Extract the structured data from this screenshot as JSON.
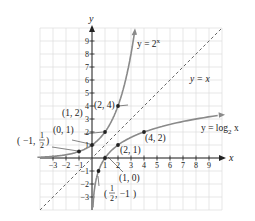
{
  "chart_data": {
    "type": "line",
    "title": "",
    "xlabel": "x",
    "ylabel": "y",
    "xlim": [
      -4,
      10
    ],
    "ylim": [
      -4,
      10
    ],
    "grid": true,
    "x_ticks": [
      -3,
      -2,
      -1,
      1,
      2,
      3,
      4,
      5,
      6,
      7,
      8,
      9
    ],
    "y_ticks": [
      -3,
      -2,
      -1,
      1,
      2,
      3,
      4,
      5,
      6,
      7,
      8,
      9
    ],
    "series": [
      {
        "name": "y = 2^x",
        "label": "y = 2",
        "label_sup": "x",
        "style": "solid",
        "color": "#8a8a8a",
        "points": [
          [
            -1,
            0.5
          ],
          [
            0,
            1
          ],
          [
            1,
            2
          ],
          [
            2,
            4
          ]
        ]
      },
      {
        "name": "y = log2 x",
        "label": "y = log",
        "label_sub": "2",
        "label_suffix": " x",
        "style": "solid",
        "color": "#8a8a8a",
        "points": [
          [
            0.5,
            -1
          ],
          [
            1,
            0
          ],
          [
            2,
            1
          ],
          [
            4,
            2
          ]
        ]
      },
      {
        "name": "y = x",
        "label": "y = x",
        "style": "dashed",
        "color": "#555555"
      }
    ],
    "annotations": [
      {
        "text": "(2, 4)",
        "point": [
          2,
          4
        ]
      },
      {
        "text": "(1, 2)",
        "point": [
          1,
          2
        ]
      },
      {
        "text": "(0, 1)",
        "point": [
          0,
          1
        ]
      },
      {
        "text": "(−1, ½)",
        "point": [
          -1,
          0.5
        ]
      },
      {
        "text": "(2, 1)",
        "point": [
          2,
          1
        ]
      },
      {
        "text": "(4, 2)",
        "point": [
          4,
          2
        ]
      },
      {
        "text": "(1, 0)",
        "point": [
          1,
          0
        ]
      },
      {
        "text": "(½, −1)",
        "point": [
          0.5,
          -1
        ]
      }
    ]
  },
  "labels": {
    "x_axis": "x",
    "y_axis": "y",
    "exp_curve": "y = 2",
    "exp_sup": "x",
    "log_curve": "y = log",
    "log_sub": "2",
    "log_x": " x",
    "identity": "y = x",
    "p_2_4": "(2, 4)",
    "p_1_2": "(1, 2)",
    "p_0_1": "(0, 1)",
    "p_m1_half_a": "−1,",
    "p_2_1": "(2, 1)",
    "p_4_2": "(4, 2)",
    "p_1_0": "(1, 0)",
    "p_half_m1_b": ", −1"
  }
}
